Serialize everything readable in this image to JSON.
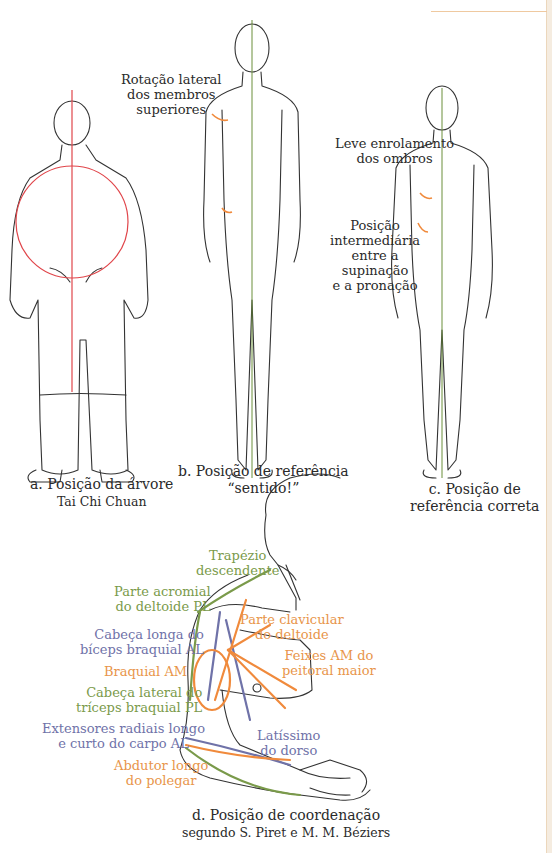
{
  "colors": {
    "axis_red": "#e0454a",
    "axis_green": "#6b8f3a",
    "arrow_orange": "#f08a3c",
    "muscle_green": "#7a9a4a",
    "muscle_blue": "#6f72a8",
    "muscle_orange": "#e8954a",
    "outline": "#333333"
  },
  "figures": {
    "a": {
      "caption_line1": "a. Posição da árvore",
      "caption_line2": "Tai Chi Chuan"
    },
    "b": {
      "annotation": [
        "Rotação lateral",
        "dos membros",
        "superiores"
      ],
      "caption_line1": "b. Posição de referência",
      "caption_line2": "“sentido!”"
    },
    "c": {
      "annotation_1": [
        "Leve enrolamento",
        "dos ombros"
      ],
      "annotation_2": [
        "Posição",
        "intermediária",
        "entre a",
        "supinação",
        "e a pronação"
      ],
      "caption_line1": "c. Posição de",
      "caption_line2": "referência correta"
    },
    "d": {
      "labels": {
        "trapezio": [
          "Trapézio",
          "descendente"
        ],
        "deltoide_acromial": [
          "Parte acromial",
          "do deltoide PL"
        ],
        "biceps": [
          "Cabeça longa do",
          "bíceps braquial AL"
        ],
        "braquial": [
          "Braquial AM"
        ],
        "triceps": [
          "Cabeça lateral do",
          "tríceps braquial PL"
        ],
        "extensores": [
          "Extensores radiais longo",
          "e curto do carpo AL"
        ],
        "abdutor": [
          "Abdutor longo",
          "do polegar"
        ],
        "deltoide_clavicular": [
          "Parte clavicular",
          "do deltoide"
        ],
        "peitoral": [
          "Feixes AM do",
          "peitoral maior"
        ],
        "latissimo": [
          "Latíssimo",
          "do dorso"
        ]
      },
      "caption_line1": "d. Posição de coordenação",
      "caption_line2": "segundo S. Piret e M. M. Béziers"
    }
  }
}
